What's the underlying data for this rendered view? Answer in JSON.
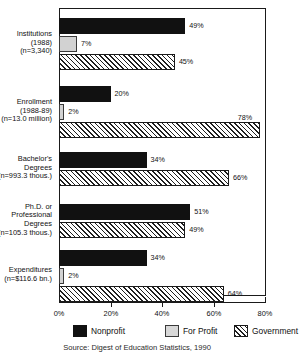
{
  "chart_data": {
    "type": "bar",
    "orientation": "horizontal",
    "title": "",
    "xlabel": "",
    "ylabel": "",
    "xlim": [
      0,
      80
    ],
    "xticks": [
      0,
      20,
      40,
      60,
      80
    ],
    "xticklabels": [
      "0%",
      "20%",
      "40%",
      "60%",
      "80%"
    ],
    "grid": false,
    "legend_position": "bottom",
    "categories": [
      "Institutions (1988) (n=3,340)",
      "Enrollment (1988-89) (n=13.0 million)",
      "Bachelor's Degrees (n=993.3 thous.)",
      "Ph.D. or Professional Degrees (n=105.3 thous.)",
      "Expenditures (n=$116.6 bn.)"
    ],
    "series": [
      {
        "name": "Nonprofit",
        "color": "#111111",
        "values": [
          49,
          20,
          34,
          51,
          34
        ]
      },
      {
        "name": "For Profit",
        "color": "#d2d2d2",
        "values": [
          7,
          2,
          null,
          null,
          2
        ]
      },
      {
        "name": "Government",
        "color": "hatch",
        "values": [
          45,
          78,
          66,
          49,
          64
        ]
      }
    ],
    "source": "Source: Digest of Education Statistics, 1990"
  },
  "groups": [
    {
      "label_lines": [
        "Institutions",
        "(1988)",
        "(n=3,340)"
      ],
      "bars": [
        {
          "series": "Nonprofit",
          "value": 49,
          "label": "49%"
        },
        {
          "series": "For Profit",
          "value": 7,
          "label": "7%"
        },
        {
          "series": "Government",
          "value": 45,
          "label": "45%"
        }
      ]
    },
    {
      "label_lines": [
        "Enrollment",
        "(1988-89)",
        "(n=13.0 million)"
      ],
      "bars": [
        {
          "series": "Nonprofit",
          "value": 20,
          "label": "20%"
        },
        {
          "series": "For Profit",
          "value": 2,
          "label": "2%"
        },
        {
          "series": "Government",
          "value": 78,
          "label": "78%"
        }
      ]
    },
    {
      "label_lines": [
        "Bachelor's",
        "Degrees",
        "(n=993.3 thous.)"
      ],
      "bars": [
        {
          "series": "Nonprofit",
          "value": 34,
          "label": "34%"
        },
        {
          "series": "Government",
          "value": 66,
          "label": "66%"
        }
      ]
    },
    {
      "label_lines": [
        "Ph.D. or",
        "Professional",
        "Degrees",
        "(n=105.3 thous.)"
      ],
      "bars": [
        {
          "series": "Nonprofit",
          "value": 51,
          "label": "51%"
        },
        {
          "series": "Government",
          "value": 49,
          "label": "49%"
        }
      ]
    },
    {
      "label_lines": [
        "Expenditures",
        "(n=$116.6 bn.)"
      ],
      "bars": [
        {
          "series": "Nonprofit",
          "value": 34,
          "label": "34%"
        },
        {
          "series": "For Profit",
          "value": 2,
          "label": "2%"
        },
        {
          "series": "Government",
          "value": 64,
          "label": "64%"
        }
      ]
    }
  ],
  "axis": {
    "ticklabels": [
      "0%",
      "20%",
      "40%",
      "60%",
      "80%"
    ],
    "values": [
      0,
      20,
      40,
      60,
      80
    ]
  },
  "legend": {
    "items": [
      {
        "label": "Nonprofit",
        "key": "nonprofit"
      },
      {
        "label": "For Profit",
        "key": "forprofit"
      },
      {
        "label": "Government",
        "key": "government"
      }
    ]
  },
  "source_note": "Source: Digest of Education Statistics, 1990"
}
